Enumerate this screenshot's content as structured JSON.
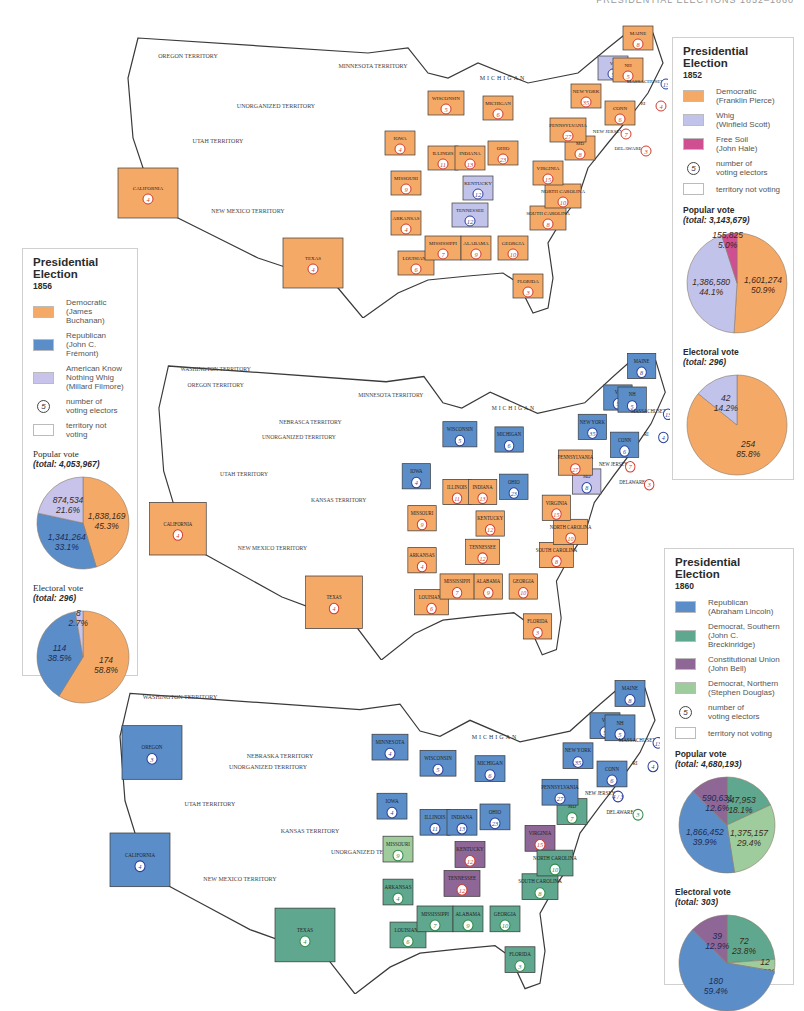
{
  "colors": {
    "democratic": "#f5a967",
    "whig": "#c2c3ea",
    "free_soil": "#cf4f92",
    "republican": "#5b8ec8",
    "know_nothing": "#c7c3ea",
    "dem_southern": "#5fa78e",
    "constitutional_union": "#8e6796",
    "dem_northern": "#9fcc9c",
    "territory": "#ffffff",
    "border": "#3a3a3a"
  },
  "maps": [
    {
      "year": "1852",
      "territories": [
        "OREGON TERRITORY",
        "MINNESOTA TERRITORY",
        "UNORGANIZED TERRITORY",
        "UTAH TERRITORY",
        "NEW MEXICO TERRITORY"
      ],
      "lake_label": "MICHIGAN",
      "states": [
        {
          "name": "CALIFORNIA",
          "electors": "4",
          "party": "democratic"
        },
        {
          "name": "TEXAS",
          "electors": "4",
          "party": "democratic"
        },
        {
          "name": "IOWA",
          "electors": "4",
          "party": "democratic"
        },
        {
          "name": "MISSOURI",
          "electors": "9",
          "party": "democratic"
        },
        {
          "name": "ARKANSAS",
          "electors": "4",
          "party": "democratic"
        },
        {
          "name": "LOUISIANA",
          "electors": "6",
          "party": "democratic"
        },
        {
          "name": "WISCONSIN",
          "electors": "5",
          "party": "democratic"
        },
        {
          "name": "MICHIGAN",
          "electors": "6",
          "party": "democratic"
        },
        {
          "name": "ILLINOIS",
          "electors": "11",
          "party": "democratic"
        },
        {
          "name": "INDIANA",
          "electors": "13",
          "party": "democratic"
        },
        {
          "name": "OHIO",
          "electors": "23",
          "party": "democratic"
        },
        {
          "name": "KENTUCKY",
          "electors": "12",
          "party": "whig"
        },
        {
          "name": "TENNESSEE",
          "electors": "12",
          "party": "whig"
        },
        {
          "name": "MISSISSIPPI",
          "electors": "7",
          "party": "democratic"
        },
        {
          "name": "ALABAMA",
          "electors": "9",
          "party": "democratic"
        },
        {
          "name": "GEORGIA",
          "electors": "10",
          "party": "democratic"
        },
        {
          "name": "FLORIDA",
          "electors": "3",
          "party": "democratic"
        },
        {
          "name": "SOUTH CAROLINA",
          "electors": "8",
          "party": "democratic"
        },
        {
          "name": "NORTH CAROLINA",
          "electors": "10",
          "party": "democratic"
        },
        {
          "name": "VIRGINIA",
          "electors": "15",
          "party": "democratic"
        },
        {
          "name": "MD",
          "electors": "8",
          "party": "democratic"
        },
        {
          "name": "PENNSYLVANIA",
          "electors": "27",
          "party": "democratic"
        },
        {
          "name": "NEW YORK",
          "electors": "35",
          "party": "democratic"
        },
        {
          "name": "NEW JERSEY",
          "electors": "7",
          "party": "democratic"
        },
        {
          "name": "DELAWARE",
          "electors": "3",
          "party": "democratic"
        },
        {
          "name": "VT",
          "electors": "5",
          "party": "whig"
        },
        {
          "name": "NH",
          "electors": "5",
          "party": "democratic"
        },
        {
          "name": "MAINE",
          "electors": "8",
          "party": "democratic"
        },
        {
          "name": "MASSACHUSETTS",
          "electors": "13",
          "party": "whig"
        },
        {
          "name": "CONN",
          "electors": "6",
          "party": "democratic"
        },
        {
          "name": "RI",
          "electors": "4",
          "party": "democratic"
        }
      ]
    },
    {
      "year": "1856",
      "territories": [
        "WASHINGTON TERRITORY",
        "OREGON TERRITORY",
        "NEBRASCA TERRITORY",
        "MINNESOTA TERRITORY",
        "UTAH TERRITORY",
        "KANSAS TERRITORY",
        "UNORGANIZED TERRITORY",
        "NEW MEXICO TERRITORY"
      ],
      "lake_label": "MICHIGAN",
      "states": [
        {
          "name": "CALIFORNIA",
          "electors": "4",
          "party": "democratic"
        },
        {
          "name": "TEXAS",
          "electors": "4",
          "party": "democratic"
        },
        {
          "name": "IOWA",
          "electors": "4",
          "party": "republican"
        },
        {
          "name": "MISSOURI",
          "electors": "9",
          "party": "democratic"
        },
        {
          "name": "ARKANSAS",
          "electors": "4",
          "party": "democratic"
        },
        {
          "name": "LOUISIANA",
          "electors": "6",
          "party": "democratic"
        },
        {
          "name": "WISCONSIN",
          "electors": "5",
          "party": "republican"
        },
        {
          "name": "MICHIGAN",
          "electors": "6",
          "party": "republican"
        },
        {
          "name": "ILLINOIS",
          "electors": "11",
          "party": "democratic"
        },
        {
          "name": "INDIANA",
          "electors": "13",
          "party": "democratic"
        },
        {
          "name": "OHIO",
          "electors": "23",
          "party": "republican"
        },
        {
          "name": "KENTUCKY",
          "electors": "12",
          "party": "democratic"
        },
        {
          "name": "TENNESSEE",
          "electors": "12",
          "party": "democratic"
        },
        {
          "name": "MISSISSIPPI",
          "electors": "7",
          "party": "democratic"
        },
        {
          "name": "ALABAMA",
          "electors": "9",
          "party": "democratic"
        },
        {
          "name": "GEORGIA",
          "electors": "10",
          "party": "democratic"
        },
        {
          "name": "FLORIDA",
          "electors": "3",
          "party": "democratic"
        },
        {
          "name": "SOUTH CAROLINA",
          "electors": "8",
          "party": "democratic"
        },
        {
          "name": "NORTH CAROLINA",
          "electors": "10",
          "party": "democratic"
        },
        {
          "name": "VIRGINIA",
          "electors": "15",
          "party": "democratic"
        },
        {
          "name": "MD",
          "electors": "8",
          "party": "know_nothing"
        },
        {
          "name": "PENNSYLVANIA",
          "electors": "27",
          "party": "democratic"
        },
        {
          "name": "NEW YORK",
          "electors": "35",
          "party": "republican"
        },
        {
          "name": "NEW JERSEY",
          "electors": "7",
          "party": "democratic"
        },
        {
          "name": "DELAWARE",
          "electors": "3",
          "party": "democratic"
        },
        {
          "name": "VT",
          "electors": "5",
          "party": "republican"
        },
        {
          "name": "NH",
          "electors": "5",
          "party": "republican"
        },
        {
          "name": "MAINE",
          "electors": "8",
          "party": "republican"
        },
        {
          "name": "MASSACHUSETTS",
          "electors": "13",
          "party": "republican"
        },
        {
          "name": "CONN",
          "electors": "6",
          "party": "republican"
        },
        {
          "name": "RI",
          "electors": "4",
          "party": "republican"
        }
      ]
    },
    {
      "year": "1860",
      "territories": [
        "WASHINGTON TERRITORY",
        "NEBRASKA TERRITORY",
        "UNORGANIZED TERRITORY",
        "UTAH TERRITORY",
        "KANSAS TERRITORY",
        "NEW MEXICO TERRITORY",
        "UNORGANIZED TERRITORY"
      ],
      "lake_label": "MICHIGAN",
      "states": [
        {
          "name": "OREGON",
          "electors": "3",
          "party": "republican"
        },
        {
          "name": "CALIFORNIA",
          "electors": "4",
          "party": "republican"
        },
        {
          "name": "TEXAS",
          "electors": "4",
          "party": "dem_southern"
        },
        {
          "name": "MINNESOTA",
          "electors": "4",
          "party": "republican"
        },
        {
          "name": "IOWA",
          "electors": "4",
          "party": "republican"
        },
        {
          "name": "MISSOURI",
          "electors": "9",
          "party": "dem_northern"
        },
        {
          "name": "ARKANSAS",
          "electors": "4",
          "party": "dem_southern"
        },
        {
          "name": "LOUISIANA",
          "electors": "6",
          "party": "dem_southern"
        },
        {
          "name": "WISCONSIN",
          "electors": "5",
          "party": "republican"
        },
        {
          "name": "MICHIGAN",
          "electors": "6",
          "party": "republican"
        },
        {
          "name": "ILLINOIS",
          "electors": "11",
          "party": "republican"
        },
        {
          "name": "INDIANA",
          "electors": "13",
          "party": "republican"
        },
        {
          "name": "OHIO",
          "electors": "23",
          "party": "republican"
        },
        {
          "name": "KENTUCKY",
          "electors": "12",
          "party": "constitutional_union"
        },
        {
          "name": "TENNESSEE",
          "electors": "12",
          "party": "constitutional_union"
        },
        {
          "name": "VIRGINIA",
          "electors": "15",
          "party": "constitutional_union"
        },
        {
          "name": "MISSISSIPPI",
          "electors": "7",
          "party": "dem_southern"
        },
        {
          "name": "ALABAMA",
          "electors": "9",
          "party": "dem_southern"
        },
        {
          "name": "GEORGIA",
          "electors": "10",
          "party": "dem_southern"
        },
        {
          "name": "FLORIDA",
          "electors": "3",
          "party": "dem_southern"
        },
        {
          "name": "SOUTH CAROLINA",
          "electors": "8",
          "party": "dem_southern"
        },
        {
          "name": "NORTH CAROLINA",
          "electors": "10",
          "party": "dem_southern"
        },
        {
          "name": "MD",
          "electors": "7",
          "party": "dem_southern"
        },
        {
          "name": "PENNSYLVANIA",
          "electors": "27",
          "party": "republican"
        },
        {
          "name": "NEW YORK",
          "electors": "35",
          "party": "republican"
        },
        {
          "name": "NEW JERSEY",
          "electors": "4 / 3",
          "party": "republican"
        },
        {
          "name": "DELAWARE",
          "electors": "3",
          "party": "dem_southern"
        },
        {
          "name": "VT",
          "electors": "5",
          "party": "republican"
        },
        {
          "name": "NH",
          "electors": "5",
          "party": "republican"
        },
        {
          "name": "MAINE",
          "electors": "8",
          "party": "republican"
        },
        {
          "name": "MASSACHUSETTS",
          "electors": "13",
          "party": "republican"
        },
        {
          "name": "CONN",
          "electors": "6",
          "party": "republican"
        },
        {
          "name": "RI",
          "electors": "4",
          "party": "republican"
        }
      ]
    }
  ],
  "legends": {
    "l1852": {
      "title": "Presidential Election",
      "year": "1852",
      "items": [
        {
          "line1": "Democratic",
          "line2": "(Franklin Pierce)",
          "color": "#f5a967"
        },
        {
          "line1": "Whig",
          "line2": "(Winfield Scott)",
          "color": "#c2c3ea"
        },
        {
          "line1": "Free Soil",
          "line2": "(John Hale)",
          "color": "#cf4f92"
        }
      ],
      "electors_symbol": "5",
      "electors_label_1": "number of",
      "electors_label_2": "voting electors",
      "territory_label": "territory not voting",
      "popular_title": "Popular vote",
      "popular_total": "(total: 3,143,679)",
      "electoral_title": "Electoral vote",
      "electoral_total": "(total: 296)"
    },
    "l1856": {
      "title": "Presidential Election",
      "year": "1856",
      "items": [
        {
          "line1": "Democratic",
          "line2": "(James Buchanan)",
          "color": "#f5a967"
        },
        {
          "line1": "Republican",
          "line2": "(John C. Frémont)",
          "color": "#5b8ec8"
        },
        {
          "line1": "American Know",
          "line2": "Nothing Whig",
          "line3": "(Millard Filmore)",
          "color": "#c7c3ea"
        }
      ],
      "electors_symbol": "5",
      "electors_label_1": "number of",
      "electors_label_2": "voting electors",
      "territory_label": "territory not voting",
      "popular_title": "Popular vote",
      "popular_total": "(total: 4,053,967)",
      "electoral_title": "Electoral vote",
      "electoral_total": "(total: 296)"
    },
    "l1860": {
      "title": "Presidential Election",
      "year": "1860",
      "items": [
        {
          "line1": "Republican",
          "line2": "(Abraham Lincoln)",
          "color": "#5b8ec8"
        },
        {
          "line1": "Democrat, Southern",
          "line2": "(John C. Breckinridge)",
          "color": "#5fa78e"
        },
        {
          "line1": "Constitutional Union",
          "line2": "(John Bell)",
          "color": "#8e6796"
        },
        {
          "line1": "Democrat, Northern",
          "line2": "(Stephen Douglas)",
          "color": "#9fcc9c"
        }
      ],
      "electors_symbol": "5",
      "electors_label_1": "number of",
      "electors_label_2": "voting electors",
      "territory_label": "territory not voting",
      "popular_title": "Popular vote",
      "popular_total": "(total: 4,680,193)",
      "electoral_title": "Electoral vote",
      "electoral_total": "(total: 303)"
    }
  },
  "chart_data": [
    {
      "type": "pie",
      "title": "Popular vote 1852 (total: 3,143,679)",
      "categories": [
        "Democratic (Franklin Pierce)",
        "Whig (Winfield Scott)",
        "Free Soil (John Hale)"
      ],
      "values": [
        1601274,
        1386580,
        155825
      ],
      "percent": [
        50.9,
        44.1,
        5.0
      ],
      "labels": [
        "1,601,274",
        "1,386,580",
        "155,825"
      ],
      "pct_labels": [
        "50.9%",
        "44.1%",
        "5.0%"
      ],
      "colors": [
        "#f5a967",
        "#c2c3ea",
        "#cf4f92"
      ]
    },
    {
      "type": "pie",
      "title": "Electoral vote 1852 (total: 296)",
      "categories": [
        "Democratic (Franklin Pierce)",
        "Whig (Winfield Scott)"
      ],
      "values": [
        254,
        42
      ],
      "percent": [
        85.8,
        14.2
      ],
      "labels": [
        "254",
        "42"
      ],
      "pct_labels": [
        "85.8%",
        "14.2%"
      ],
      "colors": [
        "#f5a967",
        "#c2c3ea"
      ]
    },
    {
      "type": "pie",
      "title": "Popular vote 1856 (total: 4,053,967)",
      "categories": [
        "Democratic (James Buchanan)",
        "Republican (John C. Frémont)",
        "American Know Nothing Whig (Millard Filmore)"
      ],
      "values": [
        1838169,
        1341264,
        874534
      ],
      "percent": [
        45.3,
        33.1,
        21.6
      ],
      "labels": [
        "1,838,169",
        "1,341,264",
        "874,534"
      ],
      "pct_labels": [
        "45.3%",
        "33.1%",
        "21.6%"
      ],
      "colors": [
        "#f5a967",
        "#5b8ec8",
        "#c7c3ea"
      ]
    },
    {
      "type": "pie",
      "title": "Electoral vote 1856 (total: 296)",
      "categories": [
        "Democratic (James Buchanan)",
        "Republican (John C. Frémont)",
        "American Know Nothing Whig (Millard Filmore)"
      ],
      "values": [
        174,
        114,
        8
      ],
      "percent": [
        58.8,
        38.5,
        2.7
      ],
      "labels": [
        "174",
        "114",
        "8"
      ],
      "pct_labels": [
        "58.8%",
        "38.5%",
        "2.7%"
      ],
      "colors": [
        "#f5a967",
        "#5b8ec8",
        "#c7c3ea"
      ]
    },
    {
      "type": "pie",
      "title": "Popular vote 1860 (total: 4,680,193)",
      "categories": [
        "Democrat, Southern (John C. Breckinridge)",
        "Democrat, Northern (Stephen Douglas)",
        "Republican (Abraham Lincoln)",
        "Constitutional Union (John Bell)"
      ],
      "values": [
        847953,
        1375157,
        1866452,
        590631
      ],
      "percent": [
        18.1,
        29.4,
        39.9,
        12.6
      ],
      "labels": [
        "847,953",
        "1,375,157",
        "1,866,452",
        "590,631"
      ],
      "pct_labels": [
        "18.1%",
        "29.4%",
        "39.9%",
        "12.6%"
      ],
      "colors": [
        "#5fa78e",
        "#9fcc9c",
        "#5b8ec8",
        "#8e6796"
      ]
    },
    {
      "type": "pie",
      "title": "Electoral vote 1860 (total: 303)",
      "categories": [
        "Democrat, Southern (John C. Breckinridge)",
        "Democrat, Northern (Stephen Douglas)",
        "Republican (Abraham Lincoln)",
        "Constitutional Union (John Bell)"
      ],
      "values": [
        72,
        12,
        180,
        39
      ],
      "percent": [
        23.8,
        3.9,
        59.4,
        12.9
      ],
      "labels": [
        "72",
        "12",
        "180",
        "39"
      ],
      "pct_labels": [
        "23.8%",
        "3.9%",
        "59.4%",
        "12.9%"
      ],
      "colors": [
        "#5fa78e",
        "#9fcc9c",
        "#5b8ec8",
        "#8e6796"
      ]
    }
  ]
}
